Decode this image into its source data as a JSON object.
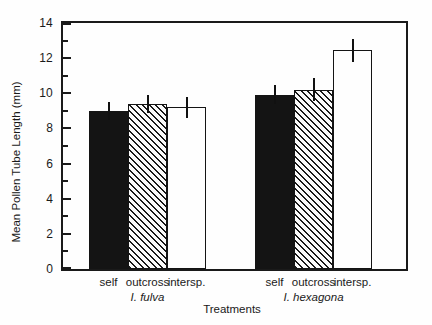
{
  "figure": {
    "background": "#fefefe",
    "ink": "#1a1a1a",
    "bar_black": "#141414",
    "bar_white": "#fefefe",
    "hatch_style": "diagonal-backslash-lines",
    "error_bar_style": "vertical-line-no-caps"
  },
  "axes": {
    "y_title": "Mean Pollen Tube Length (mm)",
    "x_title": "Treatments"
  },
  "chart_data": {
    "type": "bar",
    "title": "",
    "xlabel": "Treatments",
    "ylabel": "Mean Pollen Tube Length (mm)",
    "ylim": [
      0,
      14
    ],
    "ytick_major": [
      0,
      2,
      4,
      6,
      8,
      10,
      12,
      14
    ],
    "ytick_minor": [
      1,
      3,
      5,
      7,
      9,
      11,
      13
    ],
    "grid": false,
    "legend": false,
    "frame": "full-box",
    "groups": [
      {
        "label": "I. fulva",
        "bars": [
          {
            "category": "self",
            "fill": "black",
            "value": 9.0,
            "error": 0.5
          },
          {
            "category": "outcross",
            "fill": "hatch",
            "value": 9.4,
            "error": 0.5
          },
          {
            "category": "intersp.",
            "fill": "white",
            "value": 9.2,
            "error": 0.6
          }
        ]
      },
      {
        "label": "I. hexagona",
        "bars": [
          {
            "category": "self",
            "fill": "black",
            "value": 9.9,
            "error": 0.55
          },
          {
            "category": "outcross",
            "fill": "hatch",
            "value": 10.2,
            "error": 0.65
          },
          {
            "category": "intersp.",
            "fill": "white",
            "value": 12.45,
            "error": 0.65
          }
        ]
      }
    ]
  }
}
